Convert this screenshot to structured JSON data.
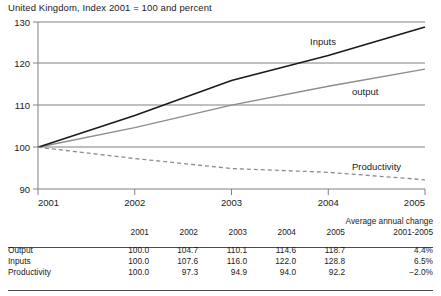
{
  "chart_title": "United Kingdom, Index 2001 = 100 and percent",
  "chart_data": {
    "type": "line",
    "title": "United Kingdom, Index 2001 = 100 and percent",
    "xlabel": "",
    "ylabel": "",
    "x": [
      "2001",
      "2002",
      "2003",
      "2004",
      "2005"
    ],
    "xtick_labels": [
      "2001",
      "2002",
      "2003",
      "2004",
      "2005"
    ],
    "ytick_labels": [
      "90",
      "100",
      "110",
      "120",
      "130"
    ],
    "ylim": [
      90,
      130
    ],
    "grid": true,
    "legend_position": "inline-annotations",
    "series": [
      {
        "name": "Inputs",
        "values": [
          100.0,
          107.6,
          116.0,
          122.0,
          128.8
        ],
        "color": "#1a1a1a",
        "style": "solid",
        "label": "Inputs"
      },
      {
        "name": "output",
        "values": [
          100.0,
          104.7,
          110.1,
          114.6,
          118.7
        ],
        "color": "#8c8c8c",
        "style": "solid",
        "label": "output"
      },
      {
        "name": "Productivity",
        "values": [
          100.0,
          97.3,
          94.9,
          94.0,
          92.2
        ],
        "color": "#8c8c8c",
        "style": "dashed",
        "label": "Productivity"
      }
    ],
    "annotations": [
      {
        "text": "Inputs",
        "x": 2002.9,
        "y": 122.5
      },
      {
        "text": "output",
        "x": 2003.6,
        "y": 112.5
      },
      {
        "text": "Productivity",
        "x": 2003.6,
        "y": 95.5
      }
    ]
  },
  "table": {
    "blank_header": "",
    "year_headers": [
      "2001",
      "2002",
      "2003",
      "2004",
      "2005"
    ],
    "avg_header_line1": "Average annual change",
    "avg_header_line2": "2001-2005",
    "rows": [
      {
        "label": "Output",
        "values": [
          "100.0",
          "104.7",
          "110.1",
          "114.6",
          "118.7"
        ],
        "average": "4.4%"
      },
      {
        "label": "Inputs",
        "values": [
          "100.0",
          "107.6",
          "116.0",
          "122.0",
          "128.8"
        ],
        "average": "6.5%"
      },
      {
        "label": "Productivity",
        "values": [
          "100.0",
          "97.3",
          "94.9",
          "94.0",
          "92.2"
        ],
        "average": "−2.0%"
      }
    ]
  },
  "colors": {
    "inputs_line": "#1a1a1a",
    "output_line": "#8c8c8c",
    "productivity_line": "#8c8c8c",
    "gridline": "#808080",
    "rule": "#4d4d4d"
  }
}
